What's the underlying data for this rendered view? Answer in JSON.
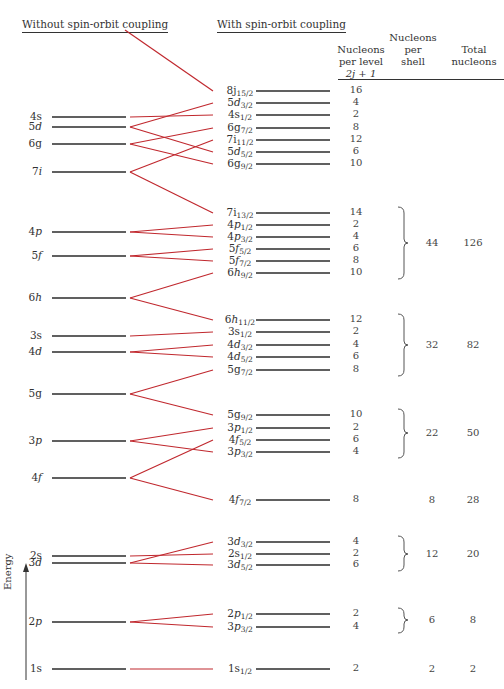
{
  "headers": {
    "without": "Without spin-orbit coupling",
    "with": "With spin-orbit coupling",
    "col_per_level": [
      "Nucleons",
      "per level",
      "2j + 1"
    ],
    "col_per_shell": [
      "Nucleons",
      "per",
      "shell"
    ],
    "col_total": [
      "Total",
      "nucleons"
    ]
  },
  "axis": {
    "label": "Energy"
  },
  "colors": {
    "level_line": "#2b2b2b",
    "connector": "#c0282e",
    "text": "#333333"
  },
  "left_levels": [
    {
      "n": "4",
      "l": "s",
      "italic": false,
      "y": 117
    },
    {
      "n": "5",
      "l": "d",
      "italic": true,
      "y": 127
    },
    {
      "n": "6",
      "l": "g",
      "italic": false,
      "y": 144
    },
    {
      "n": "7",
      "l": "i",
      "italic": true,
      "y": 172
    },
    {
      "n": "4",
      "l": "p",
      "italic": true,
      "y": 232
    },
    {
      "n": "5",
      "l": "f",
      "italic": true,
      "y": 256
    },
    {
      "n": "6",
      "l": "h",
      "italic": true,
      "y": 298
    },
    {
      "n": "3",
      "l": "s",
      "italic": false,
      "y": 336
    },
    {
      "n": "4",
      "l": "d",
      "italic": true,
      "y": 352
    },
    {
      "n": "5",
      "l": "g",
      "italic": false,
      "y": 394
    },
    {
      "n": "3",
      "l": "p",
      "italic": true,
      "y": 441
    },
    {
      "n": "4",
      "l": "f",
      "italic": true,
      "y": 478
    },
    {
      "n": "2",
      "l": "s",
      "italic": false,
      "y": 556
    },
    {
      "n": "3",
      "l": "d",
      "italic": true,
      "y": 563
    },
    {
      "n": "2",
      "l": "p",
      "italic": true,
      "y": 622
    },
    {
      "n": "1",
      "l": "s",
      "italic": false,
      "y": 669
    }
  ],
  "right_levels": [
    {
      "n": "8",
      "l": "j",
      "j": "15/2",
      "per_level": "16",
      "y": 91,
      "from": null,
      "from_y": 30
    },
    {
      "n": "5",
      "l": "d",
      "j": "3/2",
      "per_level": "4",
      "y": 103,
      "from": "5d",
      "from_y": 127
    },
    {
      "n": "4",
      "l": "s",
      "j": "1/2",
      "per_level": "2",
      "y": 115,
      "from": "4s",
      "from_y": 117
    },
    {
      "n": "6",
      "l": "g",
      "j": "7/2",
      "per_level": "8",
      "y": 128,
      "from": "6g",
      "from_y": 144
    },
    {
      "n": "7",
      "l": "i",
      "j": "11/2",
      "per_level": "12",
      "y": 140,
      "from": "7i",
      "from_y": 172
    },
    {
      "n": "5",
      "l": "d",
      "j": "5/2",
      "per_level": "6",
      "y": 152,
      "from": "5d",
      "from_y": 127
    },
    {
      "n": "6",
      "l": "g",
      "j": "9/2",
      "per_level": "10",
      "y": 164,
      "from": "6g",
      "from_y": 144
    },
    {
      "n": "7",
      "l": "i",
      "j": "13/2",
      "per_level": "14",
      "y": 213,
      "from": "7i",
      "from_y": 172
    },
    {
      "n": "4",
      "l": "p",
      "j": "1/2",
      "per_level": "2",
      "y": 225,
      "from": "4p",
      "from_y": 232
    },
    {
      "n": "4",
      "l": "p",
      "j": "3/2",
      "per_level": "4",
      "y": 237,
      "from": "4p",
      "from_y": 232
    },
    {
      "n": "5",
      "l": "f",
      "j": "5/2",
      "per_level": "6",
      "y": 249,
      "from": "5f",
      "from_y": 256
    },
    {
      "n": "5",
      "l": "f",
      "j": "7/2",
      "per_level": "8",
      "y": 261,
      "from": "5f",
      "from_y": 256
    },
    {
      "n": "6",
      "l": "h",
      "j": "9/2",
      "per_level": "10",
      "y": 273,
      "from": "6h",
      "from_y": 298
    },
    {
      "n": "6",
      "l": "h",
      "j": "11/2",
      "per_level": "12",
      "y": 320,
      "from": "6h",
      "from_y": 298
    },
    {
      "n": "3",
      "l": "s",
      "j": "1/2",
      "per_level": "2",
      "y": 332,
      "from": "3s",
      "from_y": 336
    },
    {
      "n": "4",
      "l": "d",
      "j": "3/2",
      "per_level": "4",
      "y": 345,
      "from": "4d",
      "from_y": 352
    },
    {
      "n": "4",
      "l": "d",
      "j": "5/2",
      "per_level": "6",
      "y": 357,
      "from": "4d",
      "from_y": 352
    },
    {
      "n": "5",
      "l": "g",
      "j": "7/2",
      "per_level": "8",
      "y": 370,
      "from": "5g",
      "from_y": 394
    },
    {
      "n": "5",
      "l": "g",
      "j": "9/2",
      "per_level": "10",
      "y": 415,
      "from": "5g",
      "from_y": 394
    },
    {
      "n": "3",
      "l": "p",
      "j": "1/2",
      "per_level": "2",
      "y": 428,
      "from": "3p",
      "from_y": 441
    },
    {
      "n": "4",
      "l": "f",
      "j": "5/2",
      "per_level": "6",
      "y": 440,
      "from": "4f",
      "from_y": 478
    },
    {
      "n": "3",
      "l": "p",
      "j": "3/2",
      "per_level": "4",
      "y": 452,
      "from": "3p",
      "from_y": 441
    },
    {
      "n": "4",
      "l": "f",
      "j": "7/2",
      "per_level": "8",
      "y": 500,
      "from": "4f",
      "from_y": 478
    },
    {
      "n": "3",
      "l": "d",
      "j": "3/2",
      "per_level": "4",
      "y": 542,
      "from": "3d",
      "from_y": 563
    },
    {
      "n": "2",
      "l": "s",
      "j": "1/2",
      "per_level": "2",
      "y": 554,
      "from": "2s",
      "from_y": 556
    },
    {
      "n": "3",
      "l": "d",
      "j": "5/2",
      "per_level": "6",
      "y": 565,
      "from": "3d",
      "from_y": 563
    },
    {
      "n": "2",
      "l": "p",
      "j": "1/2",
      "per_level": "2",
      "y": 614,
      "from": "2p",
      "from_y": 622
    },
    {
      "n": "3",
      "l": "p",
      "j": "3/2",
      "per_level": "4",
      "y": 627,
      "from": "2p",
      "from_y": 622
    },
    {
      "n": "1",
      "l": "s",
      "j": "1/2",
      "per_level": "2",
      "y": 669,
      "from": "1s",
      "from_y": 669
    }
  ],
  "shells": [
    {
      "per_shell": "44",
      "total": "126",
      "y_top": 213,
      "y_bot": 273,
      "y_mid": 243
    },
    {
      "per_shell": "32",
      "total": "82",
      "y_top": 320,
      "y_bot": 370,
      "y_mid": 345
    },
    {
      "per_shell": "22",
      "total": "50",
      "y_top": 415,
      "y_bot": 452,
      "y_mid": 433
    },
    {
      "per_shell": "8",
      "total": "28",
      "y_top": null,
      "y_bot": null,
      "y_mid": 500
    },
    {
      "per_shell": "12",
      "total": "20",
      "y_top": 542,
      "y_bot": 565,
      "y_mid": 554
    },
    {
      "per_shell": "6",
      "total": "8",
      "y_top": 614,
      "y_bot": 627,
      "y_mid": 620
    },
    {
      "per_shell": "2",
      "total": "2",
      "y_top": null,
      "y_bot": null,
      "y_mid": 669
    }
  ]
}
